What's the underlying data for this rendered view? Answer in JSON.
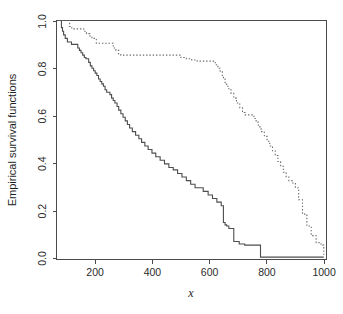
{
  "chart_data": {
    "type": "line",
    "title": "",
    "subtitle": "",
    "xlabel": "x",
    "ylabel": "Empirical survival functions",
    "xlim": [
      40,
      1030
    ],
    "ylim": [
      0.0,
      1.0
    ],
    "grid": false,
    "legend_position": "none",
    "xticks": [
      200,
      400,
      600,
      800,
      1000
    ],
    "xtick_labels": [
      "200",
      "400",
      "600",
      "800",
      "1000"
    ],
    "yticks": [
      0.0,
      0.2,
      0.4,
      0.6,
      0.8,
      1.0
    ],
    "ytick_labels": [
      "0.0",
      "0.2",
      "0.4",
      "0.6",
      "0.8",
      "1.0"
    ],
    "annotations": [],
    "colors": {
      "series_solid": "#4d4d4d",
      "series_dotted": "#6a6a6a",
      "axis": "#4a4a4a",
      "background": "#ffffff"
    },
    "series": [
      {
        "name": "solid-survival-curve",
        "style": "solid",
        "step": "hv",
        "x": [
          48,
          58,
          62,
          66,
          72,
          80,
          95,
          112,
          118,
          124,
          130,
          136,
          142,
          148,
          152,
          158,
          164,
          170,
          176,
          182,
          188,
          194,
          200,
          206,
          212,
          218,
          224,
          230,
          236,
          242,
          248,
          254,
          262,
          268,
          276,
          284,
          292,
          300,
          308,
          318,
          330,
          342,
          352,
          364,
          376,
          390,
          404,
          420,
          436,
          452,
          468,
          484,
          500,
          516,
          532,
          548,
          560,
          578,
          596,
          612,
          628,
          644,
          652,
          658,
          664,
          672,
          690,
          710,
          730,
          760,
          788,
          1020
        ],
        "y": [
          1.0,
          0.97,
          0.955,
          0.94,
          0.925,
          0.91,
          0.9,
          0.9,
          0.885,
          0.875,
          0.865,
          0.855,
          0.845,
          0.84,
          0.84,
          0.825,
          0.81,
          0.8,
          0.79,
          0.78,
          0.77,
          0.755,
          0.745,
          0.735,
          0.725,
          0.71,
          0.7,
          0.7,
          0.69,
          0.675,
          0.665,
          0.655,
          0.64,
          0.625,
          0.61,
          0.595,
          0.58,
          0.565,
          0.55,
          0.535,
          0.52,
          0.505,
          0.49,
          0.475,
          0.46,
          0.445,
          0.43,
          0.415,
          0.4,
          0.385,
          0.375,
          0.36,
          0.345,
          0.33,
          0.315,
          0.3,
          0.3,
          0.285,
          0.27,
          0.255,
          0.24,
          0.225,
          0.155,
          0.145,
          0.14,
          0.13,
          0.075,
          0.065,
          0.06,
          0.06,
          0.01,
          0.01
        ]
      },
      {
        "name": "dotted-survival-curve",
        "style": "dotted",
        "step": "hv",
        "x": [
          48,
          80,
          88,
          96,
          128,
          140,
          150,
          162,
          170,
          186,
          200,
          214,
          228,
          240,
          248,
          258,
          268,
          276,
          288,
          296,
          306,
          316,
          326,
          336,
          348,
          360,
          372,
          386,
          400,
          416,
          430,
          446,
          460,
          478,
          496,
          516,
          536,
          556,
          578,
          596,
          612,
          622,
          632,
          640,
          648,
          652,
          658,
          664,
          672,
          680,
          690,
          700,
          712,
          722,
          732,
          740,
          748,
          756,
          764,
          772,
          780,
          790,
          802,
          812,
          822,
          832,
          842,
          852,
          862,
          872,
          882,
          892,
          904,
          916,
          928,
          942,
          958,
          974,
          992,
          1004,
          1014,
          1020
        ],
        "y": [
          1.0,
          1.0,
          0.975,
          0.965,
          0.965,
          0.955,
          0.945,
          0.935,
          0.925,
          0.905,
          0.905,
          0.905,
          0.905,
          0.905,
          0.885,
          0.875,
          0.86,
          0.855,
          0.855,
          0.855,
          0.855,
          0.855,
          0.855,
          0.855,
          0.855,
          0.855,
          0.855,
          0.855,
          0.855,
          0.855,
          0.855,
          0.855,
          0.855,
          0.855,
          0.845,
          0.84,
          0.835,
          0.83,
          0.83,
          0.83,
          0.83,
          0.815,
          0.8,
          0.785,
          0.77,
          0.755,
          0.74,
          0.725,
          0.71,
          0.695,
          0.675,
          0.655,
          0.635,
          0.615,
          0.605,
          0.605,
          0.605,
          0.605,
          0.59,
          0.575,
          0.555,
          0.535,
          0.515,
          0.495,
          0.475,
          0.455,
          0.435,
          0.41,
          0.39,
          0.365,
          0.345,
          0.33,
          0.32,
          0.3,
          0.25,
          0.19,
          0.14,
          0.1,
          0.07,
          0.065,
          0.06,
          0.02
        ]
      }
    ]
  },
  "axes": {
    "y_label": "Empirical survival functions",
    "x_label": "x",
    "x_tick_labels": [
      "200",
      "400",
      "600",
      "800",
      "1000"
    ],
    "y_tick_labels": [
      "0.0",
      "0.2",
      "0.4",
      "0.6",
      "0.8",
      "1.0"
    ]
  }
}
